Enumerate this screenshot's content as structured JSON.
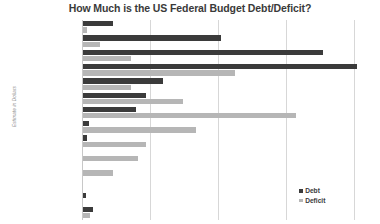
{
  "chart_data": {
    "type": "bar",
    "orientation": "horizontal",
    "title": "How Much is the US Federal Budget Debt/Deficit?",
    "xlabel": "",
    "ylabel": "Estimate in Dollars",
    "grid": true,
    "legend_position": "bottom-right",
    "axis_scale_note": "magnitude buckets",
    "categories": [
      "Quadrillions",
      "Hundred Trillions",
      "Ten Trillions",
      "Trillions",
      "Hundred Billions",
      "Ten Billions",
      "Billions",
      "Hundred Millions",
      "Ten Millions",
      "Millions",
      "Hundred Thousands",
      "Ten Thousands",
      "Thousands",
      "Hundreds"
    ],
    "series": [
      {
        "name": "Debt",
        "color": "#3b3b3b",
        "values": [
          30,
          138,
          240,
          274,
          80,
          63,
          53,
          6,
          4,
          0,
          0,
          0,
          3,
          10
        ]
      },
      {
        "name": "Deficit",
        "color": "#b6b6b6",
        "values": [
          4,
          17,
          48,
          152,
          48,
          100,
          213,
          113,
          63,
          55,
          30,
          0,
          0,
          7
        ]
      }
    ],
    "xlim": [
      0,
      288
    ],
    "gridline_positions": [
      68,
      136,
      204,
      272
    ]
  },
  "legend": {
    "items": [
      {
        "label": "Debt",
        "color": "#3b3b3b"
      },
      {
        "label": "Deficit",
        "color": "#b6b6b6"
      }
    ]
  }
}
